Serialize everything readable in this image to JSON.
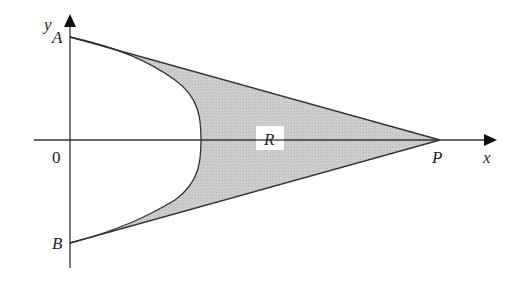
{
  "figure": {
    "labels": {
      "y_axis": "y",
      "x_axis": "x",
      "origin": "0",
      "point_a": "A",
      "point_b": "B",
      "point_p": "P",
      "region": "R"
    },
    "colors": {
      "region_fill": "#c8c8c8",
      "line": "#333333",
      "background": "#ffffff"
    }
  }
}
